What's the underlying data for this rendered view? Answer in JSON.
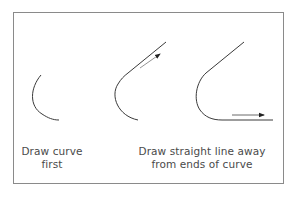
{
  "diagram": {
    "steps": [
      {
        "id": "step-1",
        "caption_lines": [
          "Draw curve",
          "first"
        ]
      },
      {
        "id": "step-2",
        "caption_lines": []
      },
      {
        "id": "step-3",
        "caption_lines": []
      }
    ],
    "shared_caption_lines": [
      "Draw straight line away",
      "from ends of curve"
    ],
    "colors": {
      "line": "#3a3a3a",
      "border": "#8a8a8a",
      "text": "#4a4a4a",
      "background": "#ffffff"
    }
  }
}
